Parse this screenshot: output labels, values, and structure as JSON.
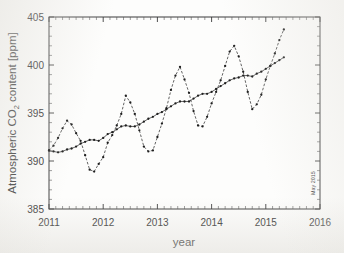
{
  "figure": {
    "annotation_right": "May 2015",
    "background_color": "#fdfdfc",
    "ink_color": "#2f2f2f"
  },
  "chart_data": {
    "type": "line",
    "title": "",
    "subtitle": "",
    "xlabel": "year",
    "ylabel": "Atmospheric CO2 content [ppm]",
    "ylabel_display": "Atmospheric CO",
    "ylabel_sub": "2",
    "ylabel_tail": " content [ppm]",
    "xlim": [
      2011,
      2016
    ],
    "ylim": [
      385,
      405
    ],
    "xticks": [
      2011,
      2012,
      2013,
      2014,
      2015,
      2016
    ],
    "xticklabels": [
      "2011",
      "2012",
      "2013",
      "2014",
      "2015",
      "2016"
    ],
    "yticks": [
      385,
      390,
      395,
      400,
      405
    ],
    "yticklabels": [
      "385",
      "390",
      "395",
      "400",
      "405"
    ],
    "x_minor_tick_interval": 0.125,
    "y_minor_tick_interval": 1,
    "grid": false,
    "legend_position": "none",
    "marker": "filled-circle",
    "annotations": [
      {
        "text": "May 2015",
        "orientation": "vertical",
        "x": 2015.85,
        "y": 387.5
      }
    ],
    "series": [
      {
        "name": "Monthly mean CO2",
        "style": "dashed",
        "x": [
          2011.0,
          2011.083,
          2011.167,
          2011.25,
          2011.333,
          2011.417,
          2011.5,
          2011.583,
          2011.667,
          2011.75,
          2011.833,
          2011.917,
          2012.0,
          2012.083,
          2012.167,
          2012.25,
          2012.333,
          2012.417,
          2012.5,
          2012.583,
          2012.667,
          2012.75,
          2012.833,
          2012.917,
          2013.0,
          2013.083,
          2013.167,
          2013.25,
          2013.333,
          2013.417,
          2013.5,
          2013.583,
          2013.667,
          2013.75,
          2013.833,
          2013.917,
          2014.0,
          2014.083,
          2014.167,
          2014.25,
          2014.333,
          2014.417,
          2014.5,
          2014.583,
          2014.667,
          2014.75,
          2014.833,
          2014.917,
          2015.0,
          2015.083,
          2015.167,
          2015.25,
          2015.333
        ],
        "values": [
          391.1,
          391.6,
          392.4,
          393.4,
          394.2,
          393.8,
          392.9,
          392.1,
          390.6,
          389.1,
          388.9,
          389.7,
          390.4,
          391.9,
          392.7,
          393.7,
          394.9,
          396.8,
          396.1,
          394.9,
          393.2,
          391.5,
          391.0,
          391.1,
          392.5,
          393.9,
          395.5,
          397.4,
          398.9,
          399.8,
          398.5,
          397.1,
          395.2,
          393.7,
          393.6,
          394.6,
          396.0,
          397.2,
          398.4,
          399.9,
          401.4,
          402.0,
          400.9,
          399.3,
          397.2,
          395.4,
          395.9,
          396.9,
          398.5,
          399.9,
          401.2,
          402.6,
          403.7
        ]
      },
      {
        "name": "Trend (seasonally adjusted)",
        "style": "solid",
        "x": [
          2011.0,
          2011.083,
          2011.167,
          2011.25,
          2011.333,
          2011.417,
          2011.5,
          2011.583,
          2011.667,
          2011.75,
          2011.833,
          2011.917,
          2012.0,
          2012.083,
          2012.167,
          2012.25,
          2012.333,
          2012.417,
          2012.5,
          2012.583,
          2012.667,
          2012.75,
          2012.833,
          2012.917,
          2013.0,
          2013.083,
          2013.167,
          2013.25,
          2013.333,
          2013.417,
          2013.5,
          2013.583,
          2013.667,
          2013.75,
          2013.833,
          2013.917,
          2014.0,
          2014.083,
          2014.167,
          2014.25,
          2014.333,
          2014.417,
          2014.5,
          2014.583,
          2014.667,
          2014.75,
          2014.833,
          2014.917,
          2015.0,
          2015.083,
          2015.167,
          2015.25,
          2015.333
        ],
        "values": [
          391.1,
          391.0,
          390.9,
          391.0,
          391.2,
          391.3,
          391.5,
          391.8,
          392.0,
          392.2,
          392.2,
          392.1,
          392.4,
          392.8,
          393.0,
          393.3,
          393.6,
          393.7,
          393.6,
          393.6,
          393.8,
          394.1,
          394.4,
          394.6,
          394.9,
          395.1,
          395.4,
          395.7,
          396.0,
          396.2,
          396.2,
          396.2,
          396.5,
          396.8,
          397.0,
          397.0,
          397.2,
          397.5,
          397.8,
          398.1,
          398.4,
          398.6,
          398.7,
          398.9,
          398.9,
          398.8,
          399.1,
          399.3,
          399.6,
          399.9,
          400.2,
          400.5,
          400.8
        ]
      }
    ]
  }
}
